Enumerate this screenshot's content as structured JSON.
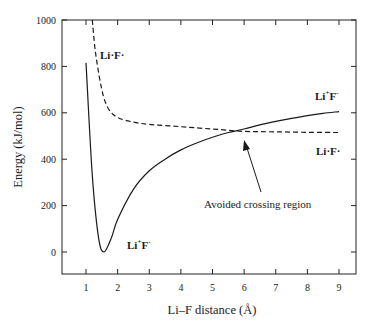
{
  "chart_data": {
    "type": "line",
    "title": "",
    "xlabel": "Li–F distance (Å)",
    "ylabel": "Energy (kJ/mol)",
    "xlim": [
      0.25,
      9.5
    ],
    "ylim": [
      -80,
      1000
    ],
    "xticks": [
      1,
      2,
      3,
      4,
      5,
      6,
      7,
      8,
      9
    ],
    "yticks": [
      0,
      200,
      400,
      600,
      800,
      1000
    ],
    "grid": false,
    "legend": "none (inline curve labels)",
    "series": [
      {
        "name": "Li+F- (ionic)",
        "style": "solid",
        "x": [
          1.0,
          1.2,
          1.4,
          1.57,
          1.8,
          2.0,
          2.5,
          3.0,
          3.5,
          4.0,
          4.5,
          5.0,
          5.5,
          6.0,
          6.5,
          7.0,
          7.5,
          8.0,
          8.5,
          9.0
        ],
        "y": [
          815,
          330,
          60,
          0,
          60,
          140,
          270,
          350,
          400,
          440,
          470,
          495,
          515,
          530,
          548,
          563,
          576,
          588,
          598,
          605
        ]
      },
      {
        "name": "Li·F· (covalent)",
        "style": "dashed",
        "x": [
          1.2,
          1.3,
          1.5,
          1.7,
          2.0,
          2.5,
          3.0,
          4.0,
          5.0,
          6.0,
          7.0,
          8.0,
          9.0
        ],
        "y": [
          1000,
          860,
          700,
          620,
          580,
          560,
          550,
          540,
          530,
          520,
          518,
          516,
          515
        ]
      }
    ],
    "annotations": [
      {
        "text": "Li·F·",
        "at": "upper-left near dashed curve"
      },
      {
        "text": "Li+F-",
        "at": "near minimum of solid curve"
      },
      {
        "text": "Li+F-",
        "at": "right, above solid curve"
      },
      {
        "text": "Li·F·",
        "at": "right, below dashed curve"
      },
      {
        "text": "Avoided crossing region",
        "arrow_to": [
          5.95,
          520
        ]
      }
    ]
  },
  "labels": {
    "ylabel": "Energy (kJ/mol)",
    "xlabel": "Li–F distance (Å)",
    "covalent_top_left": {
      "base": "Li·F·"
    },
    "ionic_min": {
      "li": "Li",
      "plus": "+",
      "f": "F",
      "minus": "-"
    },
    "ionic_right": {
      "li": "Li",
      "plus": "+",
      "f": "F",
      "minus": "-"
    },
    "covalent_right": {
      "base": "Li·F·"
    },
    "avoided_crossing": "Avoided crossing region"
  },
  "ticks": {
    "x": [
      "1",
      "2",
      "3",
      "4",
      "5",
      "6",
      "7",
      "8",
      "9"
    ],
    "y": [
      "1000",
      "800",
      "600",
      "400",
      "200",
      "0"
    ]
  }
}
